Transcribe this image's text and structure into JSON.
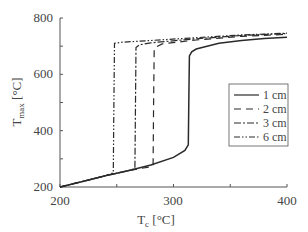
{
  "chart_data": {
    "type": "line",
    "title": "",
    "xlabel": "T_c [°C]",
    "ylabel": "T_max [°C]",
    "xlim": [
      200,
      400
    ],
    "ylim": [
      200,
      800
    ],
    "xticks": [
      200,
      300,
      400
    ],
    "yticks": [
      200,
      400,
      600,
      800
    ],
    "grid": false,
    "legend_position": "right-middle",
    "series": [
      {
        "name": "1 cm",
        "style": "solid",
        "x": [
          200,
          220,
          240,
          260,
          280,
          300,
          310,
          313,
          313.5,
          314,
          316,
          320,
          340,
          360,
          380,
          400
        ],
        "y": [
          200,
          220,
          240,
          258,
          278,
          305,
          330,
          350,
          500,
          665,
          680,
          690,
          710,
          720,
          727,
          732
        ]
      },
      {
        "name": "2 cm",
        "style": "dashed",
        "x": [
          200,
          220,
          240,
          260,
          280,
          282,
          282.5,
          283,
          286,
          290,
          320,
          360,
          400
        ],
        "y": [
          200,
          220,
          240,
          258,
          272,
          276,
          500,
          690,
          700,
          708,
          722,
          735,
          742
        ]
      },
      {
        "name": "3 cm",
        "style": "dashdot",
        "x": [
          200,
          220,
          240,
          260,
          266,
          266.5,
          267,
          270,
          280,
          320,
          360,
          400
        ],
        "y": [
          200,
          220,
          240,
          258,
          265,
          500,
          695,
          705,
          712,
          726,
          738,
          745
        ]
      },
      {
        "name": "6 cm",
        "style": "dashdotdot",
        "x": [
          200,
          220,
          240,
          247,
          247.5,
          248,
          255,
          280,
          320,
          360,
          400
        ],
        "y": [
          200,
          220,
          240,
          250,
          500,
          710,
          714,
          720,
          730,
          740,
          746
        ]
      }
    ]
  },
  "axes": {
    "x_tick_labels": [
      "200",
      "300",
      "400"
    ],
    "y_tick_labels": [
      "200",
      "400",
      "600",
      "800"
    ],
    "xlabel_main": "T",
    "xlabel_sub": "c",
    "xlabel_unit": " [°C]",
    "ylabel_main": "T",
    "ylabel_sub": "max",
    "ylabel_unit": " [°C]"
  },
  "legend": {
    "items": [
      "1 cm",
      "2 cm",
      "3 cm",
      "6 cm"
    ]
  },
  "colors": {
    "line": "#2a2a2a",
    "axis": "#555555",
    "text": "#444444"
  }
}
